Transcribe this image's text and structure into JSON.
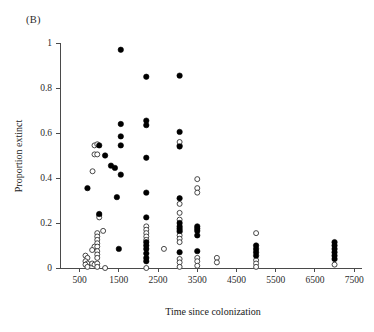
{
  "panel": {
    "label": "(B)"
  },
  "chart_data": {
    "type": "scatter",
    "title": "",
    "xlabel": "Time since colonization",
    "ylabel": "Proportion extinct",
    "xlim": [
      0,
      7700
    ],
    "ylim": [
      -0.04,
      1.04
    ],
    "xticks": [
      500,
      1500,
      2500,
      3500,
      4500,
      5500,
      6500,
      7500
    ],
    "xticklabels": [
      "500",
      "1500",
      "2500",
      "3500",
      "4500",
      "5500",
      "6500",
      "7500"
    ],
    "yticks": [
      0,
      0.2,
      0.4,
      0.6,
      0.8,
      1
    ],
    "yticklabels": [
      "0",
      "0.2",
      "0.4",
      "0.6",
      "0.8",
      "1"
    ],
    "grid": false,
    "legend": false,
    "marker_colors": {
      "filled": "#000000",
      "open_fill": "#ffffff",
      "open_edge": "#333333"
    },
    "series": [
      {
        "name": "filled",
        "marker": "filled-circle",
        "points": [
          [
            1550,
            0.97
          ],
          [
            2200,
            0.85
          ],
          [
            3050,
            0.855
          ],
          [
            2200,
            0.655
          ],
          [
            2200,
            0.635
          ],
          [
            1550,
            0.64
          ],
          [
            3050,
            0.605
          ],
          [
            1550,
            0.585
          ],
          [
            1000,
            0.545
          ],
          [
            1550,
            0.545
          ],
          [
            3050,
            0.54
          ],
          [
            1150,
            0.5
          ],
          [
            1300,
            0.455
          ],
          [
            1400,
            0.445
          ],
          [
            1550,
            0.415
          ],
          [
            2200,
            0.49
          ],
          [
            700,
            0.355
          ],
          [
            1450,
            0.315
          ],
          [
            2200,
            0.335
          ],
          [
            3050,
            0.31
          ],
          [
            2200,
            0.225
          ],
          [
            1000,
            0.24
          ],
          [
            3050,
            0.2
          ],
          [
            3050,
            0.185
          ],
          [
            3050,
            0.175
          ],
          [
            3050,
            0.165
          ],
          [
            3500,
            0.185
          ],
          [
            3500,
            0.175
          ],
          [
            3500,
            0.165
          ],
          [
            3500,
            0.145
          ],
          [
            1500,
            0.085
          ],
          [
            2200,
            0.115
          ],
          [
            2200,
            0.1
          ],
          [
            2200,
            0.085
          ],
          [
            2200,
            0.065
          ],
          [
            2200,
            0.045
          ],
          [
            2200,
            0.03
          ],
          [
            3050,
            0.07
          ],
          [
            3500,
            0.075
          ],
          [
            5000,
            0.1
          ],
          [
            5000,
            0.085
          ],
          [
            5000,
            0.07
          ],
          [
            5000,
            0.055
          ],
          [
            7000,
            0.115
          ],
          [
            7000,
            0.1
          ],
          [
            7000,
            0.085
          ],
          [
            7000,
            0.07
          ],
          [
            7000,
            0.055
          ],
          [
            7000,
            0.04
          ]
        ]
      },
      {
        "name": "open",
        "marker": "open-circle",
        "points": [
          [
            880,
            0.545
          ],
          [
            950,
            0.55
          ],
          [
            880,
            0.505
          ],
          [
            950,
            0.505
          ],
          [
            3050,
            0.545
          ],
          [
            3050,
            0.56
          ],
          [
            830,
            0.43
          ],
          [
            3500,
            0.395
          ],
          [
            3500,
            0.355
          ],
          [
            3500,
            0.335
          ],
          [
            1000,
            0.235
          ],
          [
            1000,
            0.225
          ],
          [
            1100,
            0.165
          ],
          [
            3050,
            0.285
          ],
          [
            3050,
            0.245
          ],
          [
            3050,
            0.215
          ],
          [
            950,
            0.155
          ],
          [
            950,
            0.14
          ],
          [
            950,
            0.125
          ],
          [
            950,
            0.11
          ],
          [
            880,
            0.095
          ],
          [
            950,
            0.095
          ],
          [
            820,
            0.08
          ],
          [
            950,
            0.075
          ],
          [
            950,
            0.06
          ],
          [
            950,
            0.045
          ],
          [
            650,
            0.055
          ],
          [
            700,
            0.045
          ],
          [
            650,
            0.03
          ],
          [
            700,
            0.02
          ],
          [
            650,
            0.015
          ],
          [
            700,
            0.005
          ],
          [
            820,
            0.02
          ],
          [
            880,
            0.015
          ],
          [
            950,
            0.02
          ],
          [
            950,
            0.005
          ],
          [
            1150,
            0.0
          ],
          [
            2200,
            0.185
          ],
          [
            2200,
            0.17
          ],
          [
            2200,
            0.155
          ],
          [
            2200,
            0.14
          ],
          [
            2200,
            0.125
          ],
          [
            2200,
            0.0
          ],
          [
            2650,
            0.085
          ],
          [
            3050,
            0.16
          ],
          [
            3050,
            0.145
          ],
          [
            3050,
            0.13
          ],
          [
            3050,
            0.115
          ],
          [
            3050,
            0.04
          ],
          [
            3050,
            0.025
          ],
          [
            3050,
            0.005
          ],
          [
            3500,
            0.045
          ],
          [
            3500,
            0.03
          ],
          [
            3500,
            0.01
          ],
          [
            4000,
            0.045
          ],
          [
            4000,
            0.025
          ],
          [
            5000,
            0.155
          ],
          [
            5000,
            0.035
          ],
          [
            5000,
            0.02
          ],
          [
            5000,
            0.005
          ],
          [
            7000,
            0.015
          ]
        ]
      }
    ]
  }
}
